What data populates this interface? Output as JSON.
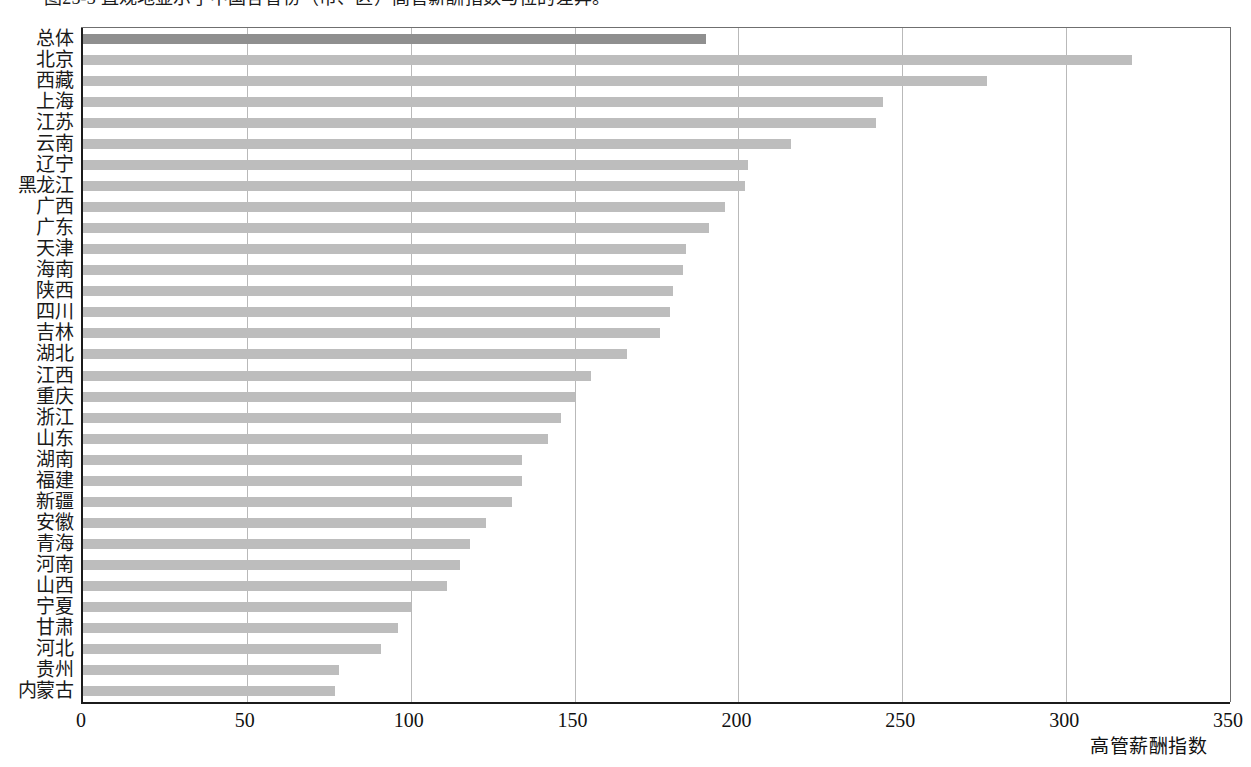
{
  "figure": {
    "caption": "图25-3 直观地显示了中国各省份（市、区）高管薪酬指数与位的差异。"
  },
  "chart_data": {
    "type": "bar",
    "orientation": "horizontal",
    "title": "",
    "xlabel": "高管薪酬指数",
    "ylabel": "",
    "xlim": [
      0,
      350
    ],
    "xticks": [
      "0",
      "50",
      "100",
      "150",
      "200",
      "250",
      "300",
      "350"
    ],
    "grid": true,
    "legend": false,
    "bar_color": "#bdbdbd",
    "accent_color": "#8f8f8f",
    "accent_category": "总体",
    "categories": [
      "总体",
      "北京",
      "西藏",
      "上海",
      "江苏",
      "云南",
      "辽宁",
      "黑龙江",
      "广西",
      "广东",
      "天津",
      "海南",
      "陕西",
      "四川",
      "吉林",
      "湖北",
      "江西",
      "重庆",
      "浙江",
      "山东",
      "湖南",
      "福建",
      "新疆",
      "安徽",
      "青海",
      "河南",
      "山西",
      "宁夏",
      "甘肃",
      "河北",
      "贵州",
      "内蒙古"
    ],
    "values": [
      190,
      320,
      276,
      244,
      242,
      216,
      203,
      202,
      196,
      191,
      184,
      183,
      180,
      179,
      176,
      166,
      155,
      150,
      146,
      142,
      134,
      134,
      131,
      123,
      118,
      115,
      111,
      100,
      96,
      91,
      78,
      77
    ]
  }
}
